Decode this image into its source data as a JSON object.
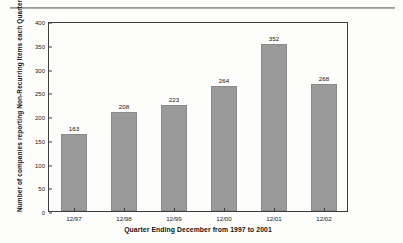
{
  "chart_data": {
    "type": "bar",
    "title": "",
    "xlabel": "Quarter Ending December from 1997 to 2001",
    "ylabel": "Number of  companies reporting Non-Recurring Items each Quarter",
    "categories": [
      "12/97",
      "12/98",
      "12/99",
      "12/00",
      "12/01",
      "12/02"
    ],
    "values": [
      163,
      208,
      223,
      264,
      352,
      268
    ],
    "ylim": [
      0,
      400
    ],
    "yticks": [
      0,
      50,
      100,
      150,
      200,
      250,
      300,
      350,
      400
    ],
    "ytick_labels": [
      "0",
      "50",
      "100",
      "150",
      "200",
      "250",
      "300",
      "350",
      "400"
    ],
    "data_labels": [
      "163",
      "208",
      "223",
      "264",
      "352",
      "268"
    ],
    "grid": false,
    "legend": false,
    "bar_color": "#9a9a9a",
    "axis_color": "#3d3d3d",
    "text_color": "#111111",
    "background": "#fdfdfc"
  }
}
